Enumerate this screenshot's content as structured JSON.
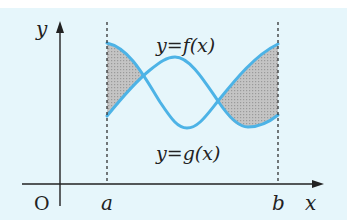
{
  "diagram": {
    "type": "area-between-curves",
    "background_color": "#e6f6fb",
    "curve_color": "#4db3e6",
    "shade_color": "#b8b8b8",
    "axes": {
      "x_label": "x",
      "y_label": "y",
      "origin_label": "O"
    },
    "bounds": {
      "left_label": "a",
      "right_label": "b"
    },
    "curves": [
      {
        "id": "f",
        "label": "y=f(x)"
      },
      {
        "id": "g",
        "label": "y=g(x)"
      }
    ],
    "regions": [
      {
        "id": "shaded-left",
        "description": "area between curves from a to first intersection"
      },
      {
        "id": "shaded-right",
        "description": "area between curves from second intersection to b"
      }
    ]
  }
}
